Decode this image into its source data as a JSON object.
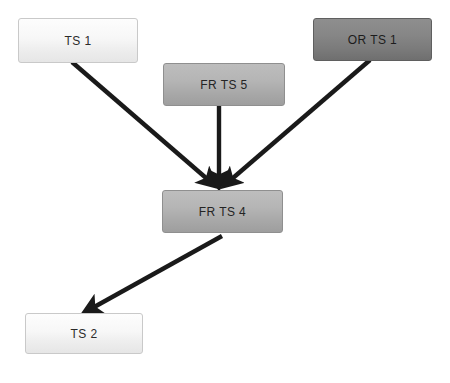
{
  "diagram": {
    "background_color": "#ffffff",
    "edge_color": "#1a1a1a",
    "nodes": [
      {
        "id": "ts1",
        "label": "TS 1",
        "tone": "light",
        "x": 18,
        "y": 18,
        "width": 120,
        "height": 45
      },
      {
        "id": "frts5",
        "label": "FR TS 5",
        "tone": "medium",
        "x": 163,
        "y": 63,
        "width": 122,
        "height": 43
      },
      {
        "id": "orts1",
        "label": "OR TS 1",
        "tone": "dark",
        "x": 313,
        "y": 18,
        "width": 119,
        "height": 43
      },
      {
        "id": "frts4",
        "label": "FR TS 4",
        "tone": "medium",
        "x": 162,
        "y": 190,
        "width": 121,
        "height": 43
      },
      {
        "id": "ts2",
        "label": "TS 2",
        "tone": "light",
        "x": 25,
        "y": 313,
        "width": 118,
        "height": 41
      }
    ],
    "edges": [
      {
        "id": "ts1-to-frts4",
        "from": "ts1",
        "to": "frts4",
        "from_label": "TS 1",
        "to_label": "FR TS 4",
        "x1": 72,
        "y1": 62,
        "x2": 213,
        "y2": 184
      },
      {
        "id": "frts5-to-frts4",
        "from": "frts5",
        "to": "frts4",
        "from_label": "FR TS 5",
        "to_label": "FR TS 4",
        "x1": 219,
        "y1": 106,
        "x2": 219,
        "y2": 184
      },
      {
        "id": "orts1-to-frts4",
        "from": "orts1",
        "to": "frts4",
        "from_label": "OR TS 1",
        "to_label": "FR TS 4",
        "x1": 370,
        "y1": 60,
        "x2": 226,
        "y2": 184
      },
      {
        "id": "frts4-to-ts2",
        "from": "frts4",
        "to": "ts2",
        "from_label": "FR TS 4",
        "to_label": "TS 2",
        "x1": 222,
        "y1": 236,
        "x2": 87,
        "y2": 311
      }
    ]
  }
}
